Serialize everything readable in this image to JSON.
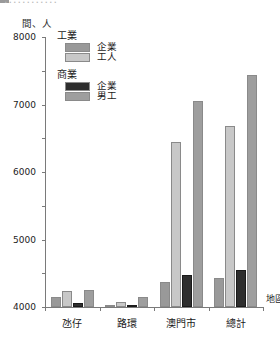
{
  "header": {
    "cropped_title": "............",
    "unit_label": "間、人",
    "marker_icon": "square-marker-icon"
  },
  "legend": {
    "groups": [
      {
        "heading": "工業",
        "items": [
          {
            "label": "企業",
            "color": "#999999",
            "key": "industry_enterprises"
          },
          {
            "label": "工人",
            "color": "#c8c8c8",
            "key": "industry_workers"
          }
        ]
      },
      {
        "heading": "商業",
        "items": [
          {
            "label": "企業",
            "color": "#2e2e2e",
            "key": "commerce_enterprises"
          },
          {
            "label": "男工",
            "color": "#9e9e9e",
            "key": "commerce_male_workers"
          }
        ]
      }
    ]
  },
  "axes": {
    "y_ticks": [
      "8000",
      "7000",
      "6000",
      "5000",
      "4000",
      "3000",
      "2000",
      "1000",
      "0"
    ],
    "x_title": "地區"
  },
  "chart_data": {
    "type": "bar",
    "title": "",
    "xlabel": "地區",
    "ylabel": "間、人",
    "ylim": [
      0,
      8000
    ],
    "ytick_step": 1000,
    "grid": false,
    "legend_position": "top-left",
    "categories": [
      "氹仔",
      "路環",
      "澳門市",
      "總計"
    ],
    "series": [
      {
        "name": "工業 企業",
        "color": "#999999",
        "values": [
          300,
          60,
          730,
          850
        ]
      },
      {
        "name": "工業 工人",
        "color": "#c8c8c8",
        "values": [
          480,
          140,
          4900,
          5350
        ]
      },
      {
        "name": "商業 企業",
        "color": "#2e2e2e",
        "values": [
          130,
          30,
          940,
          1100
        ]
      },
      {
        "name": "商業 男工",
        "color": "#9e9e9e",
        "values": [
          500,
          290,
          6100,
          6880
        ]
      }
    ]
  }
}
